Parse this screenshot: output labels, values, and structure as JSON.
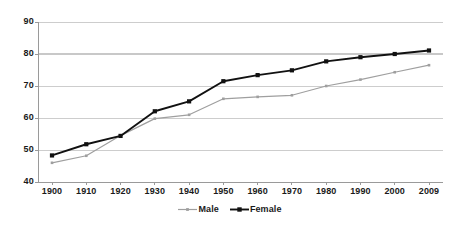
{
  "chart_data": {
    "type": "line",
    "title": "",
    "subtitle": "",
    "xlabel": "",
    "ylabel": "",
    "x": [
      "1900",
      "1910",
      "1920",
      "1930",
      "1940",
      "1950",
      "1960",
      "1970",
      "1980",
      "1990",
      "2000",
      "2009"
    ],
    "categories": [
      "1900",
      "1910",
      "1920",
      "1930",
      "1940",
      "1950",
      "1960",
      "1970",
      "1980",
      "1990",
      "2000",
      "2009"
    ],
    "series": [
      {
        "name": "Male",
        "color": "#9f9f9f",
        "marker": "small-square",
        "values": [
          46.0,
          48.2,
          54.5,
          59.8,
          61.0,
          66.0,
          66.6,
          67.1,
          70.0,
          72.0,
          74.3,
          76.5
        ]
      },
      {
        "name": "Female",
        "color": "#111111",
        "marker": "square",
        "values": [
          48.3,
          51.8,
          54.4,
          62.1,
          65.2,
          71.5,
          73.4,
          74.9,
          77.7,
          79.0,
          80.0,
          81.1
        ]
      }
    ],
    "ylim": [
      40,
      90
    ],
    "yticks": [
      40,
      50,
      60,
      70,
      80,
      90
    ],
    "ytick_labels": [
      "40",
      "50",
      "60",
      "70",
      "80",
      "90"
    ],
    "xlim": [
      "1900",
      "2009"
    ],
    "grid": "horizontal",
    "gridline_color": "#c8c8c8",
    "axis_color": "#9a9a9a",
    "legend_position": "bottom-center",
    "legend_entries": [
      "Male",
      "Female"
    ],
    "background": "#ffffff"
  }
}
